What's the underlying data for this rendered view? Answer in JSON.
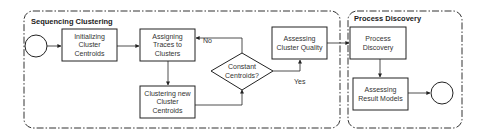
{
  "diagram": {
    "type": "process-flowchart",
    "lanes": [
      {
        "id": "seq",
        "title": "Sequencing Clustering"
      },
      {
        "id": "pd",
        "title": "Process Discovery"
      }
    ],
    "nodes": {
      "start": {
        "label": "",
        "shape": "circle"
      },
      "init": {
        "lines": [
          "Initializing",
          "Cluster",
          "Centroids"
        ]
      },
      "assign": {
        "lines": [
          "Assigning",
          "Traces to",
          "Clusters"
        ]
      },
      "newcent": {
        "lines": [
          "Clustering new",
          "Cluster",
          "Centroids"
        ]
      },
      "decision": {
        "lines": [
          "Constant",
          "Centroids?"
        ]
      },
      "quality": {
        "lines": [
          "Assessing",
          "Cluster Quality"
        ]
      },
      "discovery": {
        "lines": [
          "Process",
          "Discovery"
        ]
      },
      "result": {
        "lines": [
          "Assessing",
          "Result Models"
        ]
      },
      "end": {
        "label": "",
        "shape": "circle"
      }
    },
    "edges": [
      {
        "from": "start",
        "to": "init",
        "label": ""
      },
      {
        "from": "init",
        "to": "assign",
        "label": ""
      },
      {
        "from": "assign",
        "to": "newcent",
        "label": ""
      },
      {
        "from": "newcent",
        "to": "decision",
        "label": ""
      },
      {
        "from": "decision",
        "to": "assign",
        "label": "No"
      },
      {
        "from": "decision",
        "to": "quality",
        "label": "Yes"
      },
      {
        "from": "quality",
        "to": "discovery",
        "label": ""
      },
      {
        "from": "discovery",
        "to": "result",
        "label": ""
      },
      {
        "from": "result",
        "to": "end",
        "label": ""
      }
    ],
    "edge_labels": {
      "no": "No",
      "yes": "Yes"
    },
    "colors": {
      "stroke": "#222222",
      "lane_border": "#333333",
      "text": "#333333",
      "background": "#ffffff"
    }
  }
}
